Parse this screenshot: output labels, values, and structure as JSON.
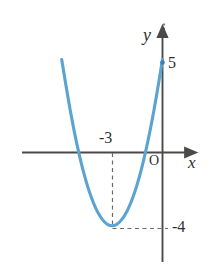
{
  "figure": {
    "background_color": "#ffffff"
  },
  "axes": {
    "x_axis_label": "x",
    "y_axis_label": "y",
    "origin_label": "O",
    "axis_color": "#4a4a48"
  },
  "labels": {
    "y_intercept": "5",
    "vertex_x": "-3",
    "vertex_y": "-4"
  },
  "colors": {
    "curve": "#5ba3d0",
    "axis": "#4a4a48",
    "dashed_guide": "#6b6b66",
    "text": "#2f2f2f"
  },
  "chart_data": {
    "type": "line",
    "title": "",
    "xlabel": "x",
    "ylabel": "y",
    "equation": "y = (x + 3)^2 - 4",
    "curve_color": "#5ba3d0",
    "grid": false,
    "legend": "none",
    "xlim": [
      -8.4,
      1.7
    ],
    "ylim": [
      -6.4,
      6.4
    ],
    "vertex": [
      -3,
      -4
    ],
    "y_intercept": 5,
    "x_intercepts": [
      -5,
      -1
    ],
    "tick_labels": {
      "x": [
        "-3"
      ],
      "y": [
        "5",
        "-4"
      ]
    },
    "annotations": [
      {
        "text": "-3",
        "x": -3,
        "y": 0.55,
        "note": "vertex x-coordinate above x-axis"
      },
      {
        "text": "-4",
        "x": 0.6,
        "y": -4,
        "note": "vertex y-coordinate right of y-axis"
      },
      {
        "text": "5",
        "x": 0.45,
        "y": 5,
        "note": "y-intercept value"
      },
      {
        "text": "O",
        "x": -0.75,
        "y": -0.6,
        "note": "origin"
      }
    ],
    "guides": [
      {
        "type": "dashed-vertical",
        "x": -3,
        "y_from": 0,
        "y_to": -4
      },
      {
        "type": "dashed-horizontal",
        "y": -4,
        "x_from": -3,
        "x_to": 0
      }
    ],
    "x": [
      -8.4,
      -8.0,
      -7.5,
      -7.0,
      -6.5,
      -6.0,
      -5.5,
      -5.0,
      -4.5,
      -4.0,
      -3.5,
      -3.0,
      -2.5,
      -2.0,
      -1.5,
      -1.0,
      -0.5,
      0.0,
      0.35
    ],
    "values": [
      25.16,
      21.0,
      16.25,
      12.0,
      8.25,
      5.0,
      2.25,
      0.0,
      -1.75,
      -3.0,
      -3.75,
      -4.0,
      -3.75,
      -3.0,
      -1.75,
      0.0,
      2.25,
      5.0,
      7.22
    ]
  }
}
